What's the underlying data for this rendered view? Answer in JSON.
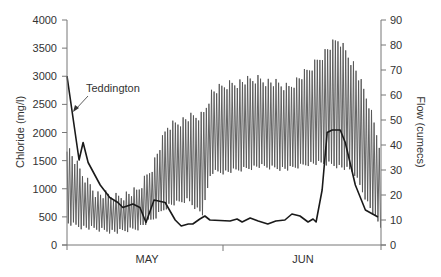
{
  "chart_data": {
    "type": "line",
    "title": "",
    "xlabel": "",
    "ylabel": "Chloride (mg/l)",
    "ylabel_right": "Flow (cumecs)",
    "ylim": [
      0,
      4000
    ],
    "ylim_right": [
      0,
      90
    ],
    "yticks": [
      0,
      500,
      1000,
      1500,
      2000,
      2500,
      3000,
      3500,
      4000
    ],
    "yticks_right": [
      0,
      10,
      20,
      30,
      40,
      50,
      60,
      70,
      80,
      90
    ],
    "x_categories": [
      "MAY",
      "JUN"
    ],
    "x_unit": "days from 1 May",
    "xlim": [
      0,
      62.4
    ],
    "grid": false,
    "legend": "none",
    "annotations": [
      {
        "text": "Teddington",
        "points_to_series": "Flow (Teddington)"
      }
    ],
    "series": [
      {
        "name": "Chloride",
        "axis": "left",
        "style": "semi-diurnal tidal oscillation (~2 cycles/day) between lower and upper envelope",
        "cycles_per_day": 1.95,
        "envelope": {
          "day": [
            0,
            3,
            6,
            10,
            14,
            17,
            20,
            24,
            27,
            28.6,
            32,
            38,
            44,
            48,
            52,
            54,
            57,
            60,
            62.4
          ],
          "upper": [
            1750,
            1250,
            900,
            850,
            950,
            1400,
            2100,
            2250,
            2300,
            2700,
            2850,
            2950,
            2800,
            3100,
            3500,
            3650,
            3200,
            2500,
            1700
          ],
          "lower": [
            400,
            320,
            280,
            230,
            300,
            450,
            700,
            800,
            550,
            1300,
            1300,
            1400,
            1350,
            1450,
            1450,
            1400,
            1300,
            700,
            300
          ]
        }
      },
      {
        "name": "Flow (Teddington)",
        "axis": "right",
        "day": [
          0,
          2.4,
          3.2,
          4.2,
          6.6,
          8.5,
          10.1,
          11.1,
          13.1,
          14.5,
          15.7,
          17.3,
          19.5,
          21.5,
          22.7,
          24.1,
          25.0,
          26.4,
          27.4,
          28.4,
          32.4,
          33.8,
          34.8,
          36.4,
          38.0,
          39.9,
          41.5,
          43.3,
          44.7,
          46.3,
          47.9,
          48.9,
          49.5,
          50.7,
          51.7,
          52.7,
          54.3,
          55.3,
          57.3,
          59.3,
          61.8
        ],
        "flow": [
          67.6,
          34,
          41,
          33,
          24,
          19,
          17,
          15,
          16.4,
          15,
          9,
          18,
          17,
          10,
          7.6,
          8.4,
          8.4,
          10.4,
          11.6,
          10,
          9.6,
          10.4,
          9.2,
          10.8,
          9.6,
          8.4,
          9.6,
          10,
          12.4,
          11.6,
          9.2,
          10.4,
          9.2,
          22,
          45,
          46,
          46,
          41,
          24,
          14,
          11.2
        ]
      }
    ]
  },
  "axes": {
    "left_title": "Chloride (mg/l)",
    "right_title": "Flow (cumecs)",
    "left_ticks": [
      "0",
      "500",
      "1000",
      "1500",
      "2000",
      "2500",
      "3000",
      "3500",
      "4000"
    ],
    "right_ticks": [
      "0",
      "10",
      "20",
      "30",
      "40",
      "50",
      "60",
      "70",
      "80",
      "90"
    ],
    "months": [
      "MAY",
      "JUN"
    ]
  },
  "annotation": {
    "label": "Teddington"
  },
  "colors": {
    "chloride": "#555555",
    "flow": "#1a1a1a",
    "axis": "#777777",
    "text": "#333333"
  }
}
